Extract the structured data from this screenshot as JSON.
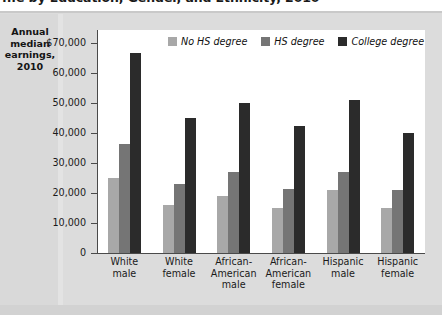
{
  "figure": {
    "title": "...e by Education, Gender, and Ethnicity, 2010",
    "axis_caption": "Annual median earnings, 2010"
  },
  "legend": {
    "position": "top-center",
    "items": [
      {
        "label": "No HS degree",
        "color": "#a8a8a8"
      },
      {
        "label": "HS degree",
        "color": "#757575"
      },
      {
        "label": "College degree",
        "color": "#2b2b2b"
      }
    ]
  },
  "axis": {
    "tick_labels": [
      "$70,000",
      "60,000",
      "50,000",
      "40,000",
      "30,000",
      "20,000",
      "10,000",
      "0"
    ],
    "tick_values": [
      70000,
      60000,
      50000,
      40000,
      30000,
      20000,
      10000,
      0
    ]
  },
  "categories_display": [
    [
      "White",
      "male"
    ],
    [
      "White",
      "female"
    ],
    [
      "African-",
      "American",
      "male"
    ],
    [
      "African-",
      "American",
      "female"
    ],
    [
      "Hispanic",
      "male"
    ],
    [
      "Hispanic",
      "female"
    ]
  ],
  "chart_data": {
    "type": "bar",
    "title": "...e by Education, Gender, and Ethnicity, 2010",
    "xlabel": "",
    "ylabel": "Annual median earnings, 2010",
    "ylim": [
      0,
      70000
    ],
    "ytick_step": 10000,
    "grid": false,
    "legend_position": "top-center",
    "categories": [
      "White male",
      "White female",
      "African-American male",
      "African-American female",
      "Hispanic male",
      "Hispanic female"
    ],
    "series": [
      {
        "name": "No HS degree",
        "color": "#a8a8a8",
        "values": [
          25000,
          16000,
          19000,
          15000,
          21000,
          15000
        ]
      },
      {
        "name": "HS degree",
        "color": "#757575",
        "values": [
          36300,
          23000,
          27000,
          21500,
          27000,
          21000
        ]
      },
      {
        "name": "College degree",
        "color": "#2b2b2b",
        "values": [
          66700,
          45000,
          50000,
          42500,
          51000,
          40000
        ]
      }
    ]
  }
}
